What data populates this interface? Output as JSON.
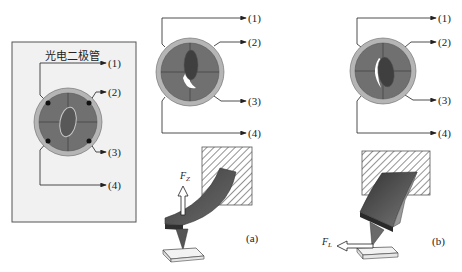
{
  "diagram": {
    "panel_left": {
      "title": "光电二极管",
      "outputs": [
        "(1)",
        "(2)",
        "(3)",
        "(4)"
      ]
    },
    "panel_middle": {
      "outputs": [
        "(1)",
        "(2)",
        "(3)",
        "(4)"
      ],
      "force_label": "F",
      "force_subscript": "Z",
      "caption": "(a)"
    },
    "panel_right": {
      "outputs": [
        "(1)",
        "(2)",
        "(3)",
        "(4)"
      ],
      "force_label": "F",
      "force_subscript": "L",
      "caption": "(b)"
    },
    "colors": {
      "photodiode_ring": "#b5b5b5",
      "quadrant_fill": "#6e6e6e",
      "spot_fill": "#4a4a4a",
      "panel_bg": "#f1f1f1",
      "cantilever": "#5a5a5a",
      "hatch": "#777777"
    }
  }
}
